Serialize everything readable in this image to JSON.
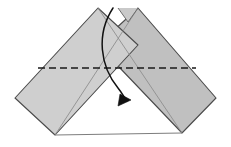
{
  "figure": {
    "canvas": {
      "width": 231,
      "height": 147,
      "background": "#ffffff"
    }
  },
  "style": {
    "paper_fill": "#c9c9c9",
    "paper_fill_light": "#cfcfcf",
    "paper_fill_shadow": "#c0c0c0",
    "outline_color": "#4a4a4a",
    "outline_width": "1.1",
    "crease_color": "#8a8a8a",
    "crease_width": "0.9",
    "fold_line_color": "#1a1a1a",
    "fold_line_width": "1.6",
    "fold_line_dash": "7,4",
    "arrow_color": "#111111",
    "arrow_width": "1.5",
    "white_gap": "#ffffff"
  },
  "shapes": {
    "left_flap": {
      "name": "left-flap",
      "points": "98,8 15,98 55,135 138,45"
    },
    "right_flap": {
      "name": "right-flap",
      "points": "138,8 216,98 182,133 98,45"
    },
    "top_notch": {
      "name": "top-notch-wedge",
      "points": "118,8 138,8 128,22"
    }
  },
  "creases": [
    {
      "name": "left-inner-crease",
      "d": "M 98,8 L 182,133"
    },
    {
      "name": "right-inner-crease",
      "d": "M 138,8 L 55,135"
    },
    {
      "name": "notch-left-crease",
      "d": "M 118,8 L 128,22"
    },
    {
      "name": "notch-right-crease",
      "d": "M 138,8 L 128,22"
    },
    {
      "name": "bottom-edge",
      "d": "M 55,135 L 182,133"
    }
  ],
  "fold_line": {
    "name": "horizontal-fold-line",
    "label": "valley fold",
    "x1": 38,
    "y1": 68,
    "x2": 196,
    "y2": 68
  },
  "arrow": {
    "name": "fold-direction-arrow",
    "label": "fold down",
    "path": "M 113,8 C 96,34 100,66 118,88 C 122,93 124,97 127,101",
    "head": "118,106 120,94 131,100"
  },
  "labels": {
    "step_number": "",
    "caption": ""
  }
}
